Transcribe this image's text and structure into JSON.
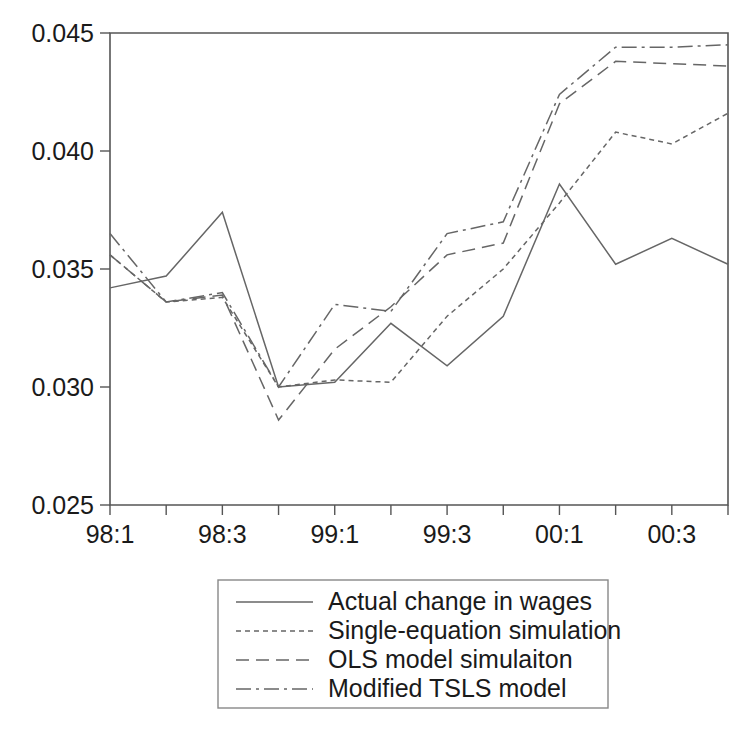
{
  "chart_data": {
    "type": "line",
    "title": "",
    "xlabel": "",
    "ylabel": "",
    "ylim": [
      0.025,
      0.045
    ],
    "yticks": [
      0.025,
      0.03,
      0.035,
      0.04,
      0.045
    ],
    "ytick_labels": [
      "0.025",
      "0.030",
      "0.035",
      "0.040",
      "0.045"
    ],
    "grid": false,
    "legend_position": "below",
    "x": [
      "98:1",
      "98:2",
      "98:3",
      "98:4",
      "99:1",
      "99:2",
      "99:3",
      "99:4",
      "00:1",
      "00:2",
      "00:3",
      "00:4"
    ],
    "xtick_labels": [
      "98:1",
      "",
      "98:3",
      "",
      "99:1",
      "",
      "99:3",
      "",
      "00:1",
      "",
      "00:3",
      ""
    ],
    "series": [
      {
        "name": "Actual change in wages",
        "style": "solid",
        "dash": "none",
        "values": [
          0.0342,
          0.0347,
          0.0374,
          0.03,
          0.0302,
          0.0327,
          0.0309,
          0.033,
          0.0386,
          0.0352,
          0.0363,
          0.0352
        ]
      },
      {
        "name": "Single-equation simulation",
        "style": "dotted",
        "dash": "5,4",
        "values": [
          0.0356,
          0.0336,
          0.0338,
          0.03,
          0.0303,
          0.0302,
          0.033,
          0.035,
          0.0378,
          0.0408,
          0.0403,
          0.0416
        ]
      },
      {
        "name": "OLS model simulaiton",
        "style": "dashed",
        "dash": "13,7",
        "values": [
          0.0356,
          0.0336,
          0.0339,
          0.0286,
          0.0316,
          0.0334,
          0.0356,
          0.0361,
          0.042,
          0.0438,
          0.0437,
          0.0436
        ]
      },
      {
        "name": "Modified TSLS model",
        "style": "dash-dot",
        "dash": "15,5,3,5",
        "values": [
          0.0365,
          0.0336,
          0.034,
          0.03,
          0.0335,
          0.0332,
          0.0365,
          0.037,
          0.0424,
          0.0444,
          0.0444,
          0.0445
        ]
      }
    ]
  },
  "legend": {
    "entries": [
      "Actual change in wages",
      "Single-equation simulation",
      "OLS model simulaiton",
      "Modified TSLS model"
    ]
  },
  "colors": {
    "line": "#666666",
    "axis": "#555555",
    "text": "#1a1a1a",
    "background": "#ffffff"
  }
}
